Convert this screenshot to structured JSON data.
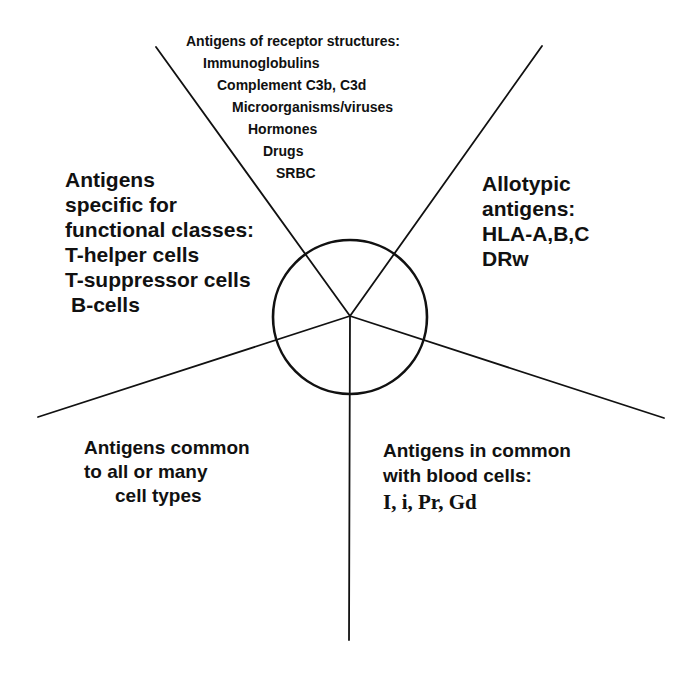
{
  "diagram": {
    "type": "radial-sector-diagram",
    "center": {
      "x": 350,
      "y": 316
    },
    "circle_radius": 77,
    "stroke_color": "#111111",
    "background": "#ffffff",
    "spokes": [
      {
        "name": "upper-left",
        "x2": 156,
        "y2": 47
      },
      {
        "name": "upper-right",
        "x2": 542,
        "y2": 46
      },
      {
        "name": "left",
        "x2": 38,
        "y2": 417
      },
      {
        "name": "right",
        "x2": 664,
        "y2": 418
      },
      {
        "name": "bottom",
        "x2": 349,
        "y2": 640
      }
    ]
  },
  "sectors": {
    "top": {
      "heading": "Antigens of receptor structures:",
      "items": [
        "Immunoglobulins",
        "Complement  C3b, C3d",
        "Microorganisms/viruses",
        "Hormones",
        "Drugs",
        "SRBC"
      ]
    },
    "left": {
      "lines": [
        "Antigens",
        "specific for",
        "functional classes:",
        "T-helper cells",
        "T-suppressor cells",
        "B-cells"
      ]
    },
    "right": {
      "lines": [
        "Allotypic",
        "antigens:",
        "HLA-A,B,C",
        "DRw"
      ]
    },
    "bottom_left": {
      "lines": [
        "Antigens  common",
        "to all or many",
        "cell types"
      ]
    },
    "bottom_right": {
      "lines": [
        "Antigens in common",
        "with blood cells:",
        "I, i, Pr, Gd"
      ]
    }
  }
}
